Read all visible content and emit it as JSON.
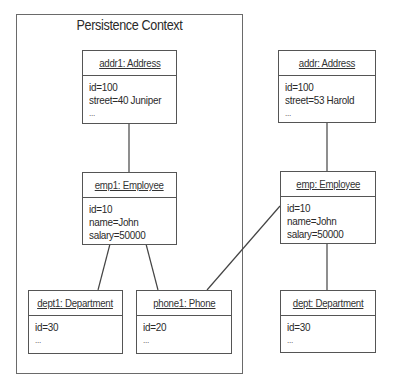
{
  "persistence_context": {
    "title": "Persistence Context"
  },
  "objects": {
    "addr1": {
      "title": "addr1: Address",
      "fields": [
        "id=100",
        "street=40 Juniper",
        "..."
      ]
    },
    "emp1": {
      "title": "emp1: Employee",
      "fields": [
        "id=10",
        "name=John",
        "salary=50000"
      ]
    },
    "dept1": {
      "title": "dept1: Department",
      "fields": [
        "id=30",
        "..."
      ]
    },
    "phone1": {
      "title": "phone1: Phone",
      "fields": [
        "id=20",
        "..."
      ]
    },
    "addr": {
      "title": "addr: Address",
      "fields": [
        "id=100",
        "street=53 Harold",
        "..."
      ]
    },
    "emp": {
      "title": "emp: Employee",
      "fields": [
        "id=10",
        "name=John",
        "salary=50000"
      ]
    },
    "dept": {
      "title": "dept: Department",
      "fields": [
        "id=30",
        "..."
      ]
    }
  },
  "connections": [
    {
      "from": "addr1",
      "to": "emp1"
    },
    {
      "from": "emp1",
      "to": "dept1"
    },
    {
      "from": "emp1",
      "to": "phone1"
    },
    {
      "from": "addr",
      "to": "emp"
    },
    {
      "from": "emp",
      "to": "dept"
    },
    {
      "from": "emp",
      "to": "phone1"
    }
  ],
  "colors": {
    "border": "#555555",
    "context_border": "#6a6a6a",
    "text": "#2a2a2a",
    "background": "#ffffff"
  }
}
